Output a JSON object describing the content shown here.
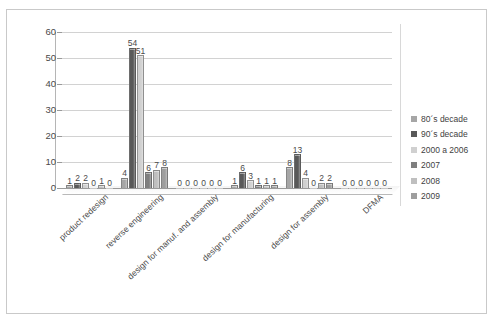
{
  "chart_data": {
    "type": "bar",
    "title": "",
    "xlabel": "",
    "ylabel": "",
    "ylim": [
      0,
      60
    ],
    "ytick_step": 10,
    "yticks": [
      "60",
      "50",
      "40",
      "30",
      "20",
      "10",
      "0"
    ],
    "grid": true,
    "legend_position": "right",
    "categories": [
      "product redesign",
      "reverse engineering",
      "design for manuf. and assembly",
      "design for manufacturing",
      "design for assembly",
      "DFMA"
    ],
    "series": [
      {
        "name": "80´s decade",
        "color": "#a6a6a6",
        "values": [
          1,
          4,
          0,
          1,
          8,
          0
        ]
      },
      {
        "name": "90´s decade",
        "color": "#595959",
        "values": [
          2,
          54,
          0,
          6,
          13,
          0
        ]
      },
      {
        "name": "2000 a 2006",
        "color": "#d0d0d0",
        "values": [
          2,
          51,
          0,
          3,
          4,
          0
        ]
      },
      {
        "name": "2007",
        "color": "#7f7f7f",
        "values": [
          0,
          6,
          0,
          1,
          0,
          0
        ]
      },
      {
        "name": "2008",
        "color": "#bfbfbf",
        "values": [
          1,
          7,
          0,
          1,
          2,
          0
        ]
      },
      {
        "name": "2009",
        "color": "#9e9e9e",
        "values": [
          0,
          8,
          0,
          1,
          2,
          0
        ]
      }
    ]
  },
  "colors": {
    "grid": "#d2d2d2",
    "axis": "#9a9a9a",
    "frame": "#c9c9c9",
    "text": "#4a4a4a"
  }
}
